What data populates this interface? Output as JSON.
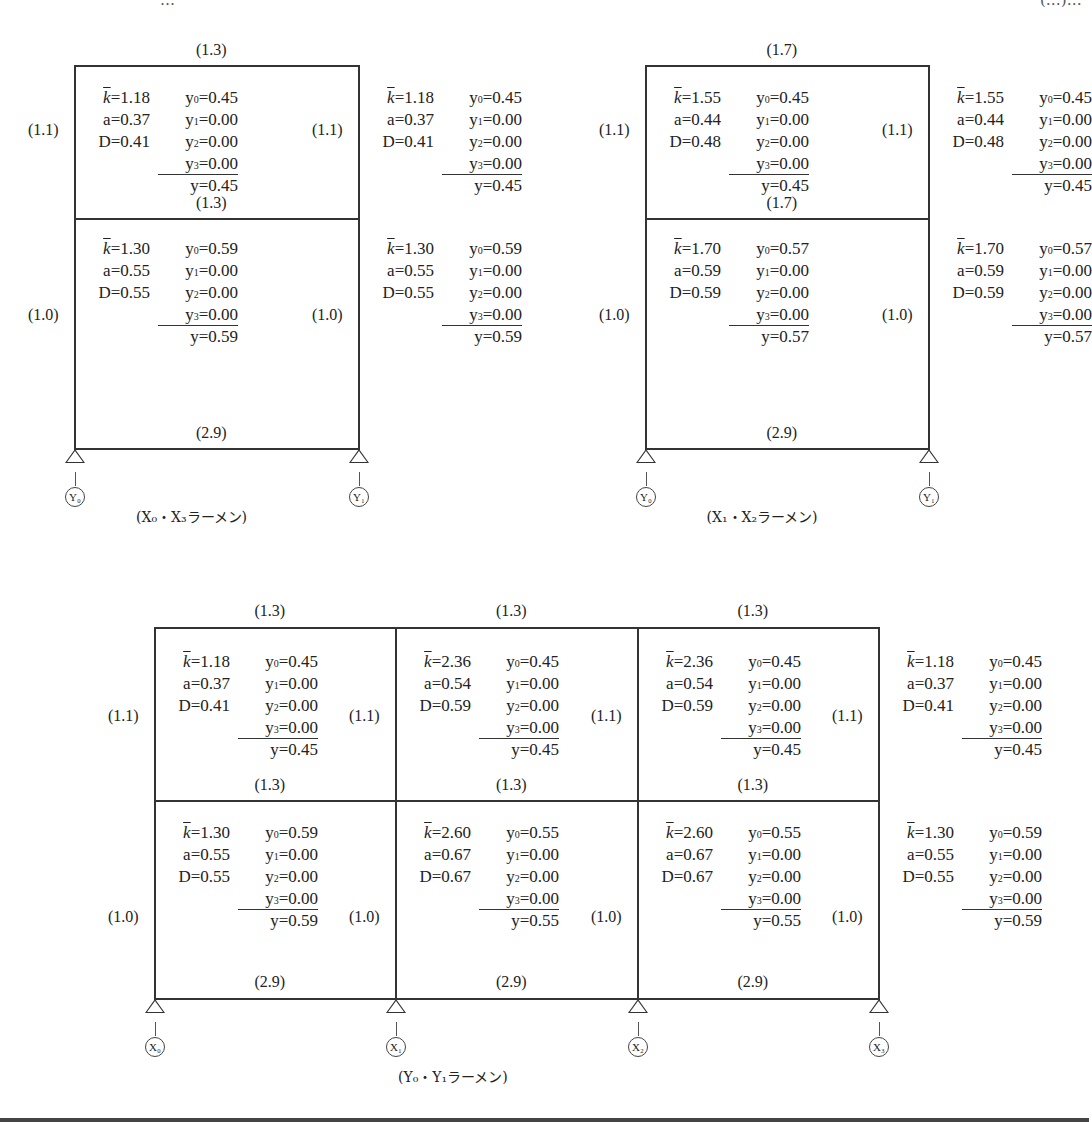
{
  "header": {
    "left_fragment": "…",
    "right_fragment": "(…)…"
  },
  "frames": [
    {
      "id": "X0-X3",
      "caption": "(X₀・X₃ラーメン)",
      "beam_stiffness": {
        "roof": "(1.3)",
        "mid": "(1.3)",
        "base": "(2.9)"
      },
      "column_stiffness": {
        "upper": "(1.1)",
        "lower": "(1.0)"
      },
      "supports": [
        "Y₀",
        "Y₁"
      ],
      "columns": [
        {
          "upper": {
            "k": "1.18",
            "a": "0.37",
            "D": "0.41",
            "y0": "0.45",
            "y1": "0.00",
            "y2": "0.00",
            "y3": "0.00",
            "y": "0.45"
          },
          "lower": {
            "k": "1.30",
            "a": "0.55",
            "D": "0.55",
            "y0": "0.59",
            "y1": "0.00",
            "y2": "0.00",
            "y3": "0.00",
            "y": "0.59"
          }
        },
        {
          "upper": {
            "k": "1.18",
            "a": "0.37",
            "D": "0.41",
            "y0": "0.45",
            "y1": "0.00",
            "y2": "0.00",
            "y3": "0.00",
            "y": "0.45"
          },
          "lower": {
            "k": "1.30",
            "a": "0.55",
            "D": "0.55",
            "y0": "0.59",
            "y1": "0.00",
            "y2": "0.00",
            "y3": "0.00",
            "y": "0.59"
          }
        }
      ]
    },
    {
      "id": "X1-X2",
      "caption": "(X₁・X₂ラーメン)",
      "beam_stiffness": {
        "roof": "(1.7)",
        "mid": "(1.7)",
        "base": "(2.9)"
      },
      "column_stiffness": {
        "upper": "(1.1)",
        "lower": "(1.0)"
      },
      "supports": [
        "Y₀",
        "Y₁"
      ],
      "columns": [
        {
          "upper": {
            "k": "1.55",
            "a": "0.44",
            "D": "0.48",
            "y0": "0.45",
            "y1": "0.00",
            "y2": "0.00",
            "y3": "0.00",
            "y": "0.45"
          },
          "lower": {
            "k": "1.70",
            "a": "0.59",
            "D": "0.59",
            "y0": "0.57",
            "y1": "0.00",
            "y2": "0.00",
            "y3": "0.00",
            "y": "0.57"
          }
        },
        {
          "upper": {
            "k": "1.55",
            "a": "0.44",
            "D": "0.48",
            "y0": "0.45",
            "y1": "0.00",
            "y2": "0.00",
            "y3": "0.00",
            "y": "0.45"
          },
          "lower": {
            "k": "1.70",
            "a": "0.59",
            "D": "0.59",
            "y0": "0.57",
            "y1": "0.00",
            "y2": "0.00",
            "y3": "0.00",
            "y": "0.57"
          }
        }
      ]
    },
    {
      "id": "Y0-Y1",
      "caption": "(Y₀・Y₁ラーメン)",
      "beam_stiffness": {
        "roof": [
          "(1.3)",
          "(1.3)",
          "(1.3)"
        ],
        "mid": [
          "(1.3)",
          "(1.3)",
          "(1.3)"
        ],
        "base": [
          "(2.9)",
          "(2.9)",
          "(2.9)"
        ]
      },
      "column_stiffness": {
        "upper": "(1.1)",
        "lower": "(1.0)"
      },
      "supports": [
        "X₀",
        "X₁",
        "X₂",
        "X₃"
      ],
      "columns": [
        {
          "upper": {
            "k": "1.18",
            "a": "0.37",
            "D": "0.41",
            "y0": "0.45",
            "y1": "0.00",
            "y2": "0.00",
            "y3": "0.00",
            "y": "0.45"
          },
          "lower": {
            "k": "1.30",
            "a": "0.55",
            "D": "0.55",
            "y0": "0.59",
            "y1": "0.00",
            "y2": "0.00",
            "y3": "0.00",
            "y": "0.59"
          }
        },
        {
          "upper": {
            "k": "2.36",
            "a": "0.54",
            "D": "0.59",
            "y0": "0.45",
            "y1": "0.00",
            "y2": "0.00",
            "y3": "0.00",
            "y": "0.45"
          },
          "lower": {
            "k": "2.60",
            "a": "0.67",
            "D": "0.67",
            "y0": "0.55",
            "y1": "0.00",
            "y2": "0.00",
            "y3": "0.00",
            "y": "0.55"
          }
        },
        {
          "upper": {
            "k": "2.36",
            "a": "0.54",
            "D": "0.59",
            "y0": "0.45",
            "y1": "0.00",
            "y2": "0.00",
            "y3": "0.00",
            "y": "0.45"
          },
          "lower": {
            "k": "2.60",
            "a": "0.67",
            "D": "0.67",
            "y0": "0.55",
            "y1": "0.00",
            "y2": "0.00",
            "y3": "0.00",
            "y": "0.55"
          }
        },
        {
          "upper": {
            "k": "1.18",
            "a": "0.37",
            "D": "0.41",
            "y0": "0.45",
            "y1": "0.00",
            "y2": "0.00",
            "y3": "0.00",
            "y": "0.45"
          },
          "lower": {
            "k": "1.30",
            "a": "0.55",
            "D": "0.55",
            "y0": "0.59",
            "y1": "0.00",
            "y2": "0.00",
            "y3": "0.00",
            "y": "0.59"
          }
        }
      ]
    }
  ],
  "symbols": {
    "kbar": "k",
    "a": "a",
    "D": "D",
    "y0": "y",
    "y1": "y",
    "y2": "y",
    "y3": "y",
    "y": "y",
    "eq": "="
  }
}
